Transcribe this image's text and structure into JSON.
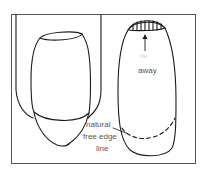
{
  "diagram": {
    "left_figure": "finger with nail and extended tip",
    "right_figure": "nail viewed with free edge line",
    "labels": {
      "away_faint": "file",
      "away": "away",
      "free_edge_line_1": "natural",
      "free_edge_line_2": "free edge",
      "free_edge_line_3": "line"
    },
    "colors": {
      "line": "#1a1a1a",
      "frame": "#555555",
      "text": "#555555",
      "background": "#ffffff"
    }
  }
}
